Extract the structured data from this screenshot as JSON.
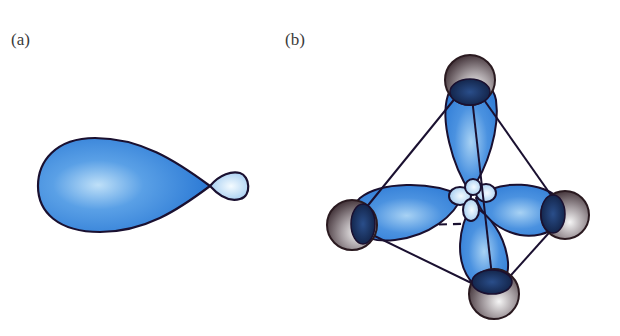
{
  "panels": [
    {
      "id": "a",
      "label": "(a)",
      "description": "single hybrid orbital with large and small lobe"
    },
    {
      "id": "b",
      "label": "(b)",
      "description": "four sp3 hybrid orbitals pointing to corners of a tetrahedron"
    }
  ],
  "colors": {
    "lobe_dark": "#1f6fd0",
    "lobe_light": "#bfe0f8",
    "outline": "#1a1030",
    "sphere_dark": "#3a2a30",
    "sphere_light": "#f2f2f2"
  }
}
